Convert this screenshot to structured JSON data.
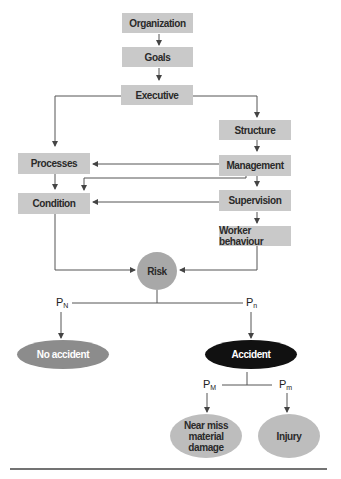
{
  "boxes": {
    "organization": "Organization",
    "goals": "Goals",
    "executive": "Executive",
    "structure": "Structure",
    "processes": "Processes",
    "management": "Management",
    "supervision": "Supervision",
    "condition": "Condition",
    "worker_behaviour": "Worker behaviour"
  },
  "nodes": {
    "risk": "Risk",
    "no_accident": "No accident",
    "accident": "Accident",
    "near_miss": "Near miss material damage",
    "injury": "Injury"
  },
  "probabilities": {
    "p_N": {
      "base": "P",
      "sub": "N"
    },
    "p_n": {
      "base": "P",
      "sub": "n"
    },
    "p_M": {
      "base": "P",
      "sub": "M"
    },
    "p_m": {
      "base": "P",
      "sub": "m"
    }
  },
  "colors": {
    "box_fill": "#c9c9c9",
    "no_accident_fill": "#8c8c8c",
    "accident_fill": "#111111",
    "line": "#555555"
  }
}
